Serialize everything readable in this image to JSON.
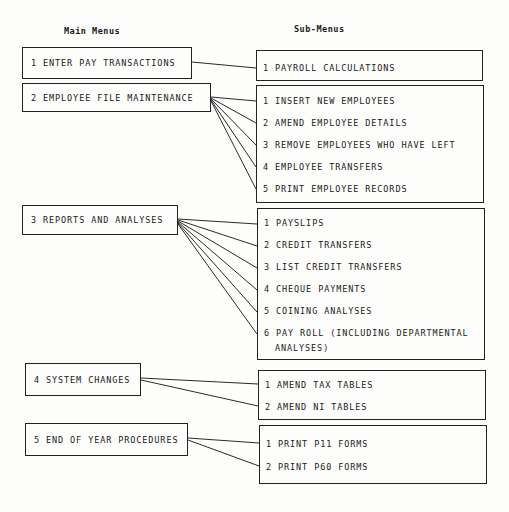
{
  "headings": {
    "main": "Main Menus",
    "sub": "Sub-Menus"
  },
  "main_menus": [
    {
      "label": "1 ENTER PAY TRANSACTIONS"
    },
    {
      "label": "2 EMPLOYEE FILE MAINTENANCE"
    },
    {
      "label": "3 REPORTS AND ANALYSES"
    },
    {
      "label": "4 SYSTEM CHANGES"
    },
    {
      "label": "5 END OF YEAR PROCEDURES"
    }
  ],
  "sub_menus": [
    {
      "items": [
        {
          "label": "1 PAYROLL CALCULATIONS"
        }
      ]
    },
    {
      "items": [
        {
          "label": "1 INSERT NEW EMPLOYEES"
        },
        {
          "label": "2 AMEND EMPLOYEE DETAILS"
        },
        {
          "label": "3 REMOVE EMPLOYEES WHO HAVE LEFT"
        },
        {
          "label": "4 EMPLOYEE TRANSFERS"
        },
        {
          "label": "5 PRINT EMPLOYEE RECORDS"
        }
      ]
    },
    {
      "items": [
        {
          "label": "1 PAYSLIPS"
        },
        {
          "label": "2 CREDIT TRANSFERS"
        },
        {
          "label": "3 LIST CREDIT TRANSFERS"
        },
        {
          "label": "4 CHEQUE PAYMENTS"
        },
        {
          "label": "5 COINING ANALYSES"
        },
        {
          "label": "6 PAY ROLL (INCLUDING DEPARTMENTAL",
          "continuation": "ANALYSES)"
        }
      ]
    },
    {
      "items": [
        {
          "label": "1 AMEND TAX TABLES"
        },
        {
          "label": "2 AMEND NI TABLES"
        }
      ]
    },
    {
      "items": [
        {
          "label": "1 PRINT P11 FORMS"
        },
        {
          "label": "2 PRINT P60 FORMS"
        }
      ]
    }
  ]
}
